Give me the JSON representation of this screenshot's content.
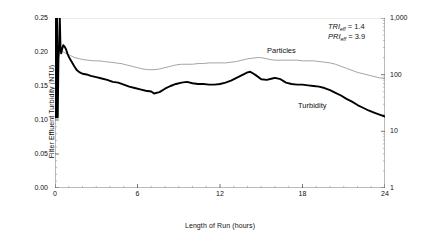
{
  "chart_data": {
    "type": "line",
    "title": "",
    "xlabel": "Length of Run  (hours)",
    "ylabel": "Filter Effluent Turbidity  (NTU)",
    "ylabel_right": "Filter Effluent Particles  (#/mL)",
    "xlim": [
      0,
      24
    ],
    "xticks": [
      "0",
      "6",
      "12",
      "18",
      "24"
    ],
    "xtick_values": [
      0,
      6,
      12,
      18,
      24
    ],
    "x_minor_tick_interval": 1,
    "ylim": [
      0.0,
      0.25
    ],
    "yticks": [
      "0.00",
      "0.05",
      "0.10",
      "0.15",
      "0.20",
      "0.25"
    ],
    "ytick_values": [
      0.0,
      0.05,
      0.1,
      0.15,
      0.2,
      0.25
    ],
    "ylim_right": [
      1,
      1000
    ],
    "yscale_right": "log",
    "yticks_right": [
      "1",
      "10",
      "100",
      "1,000"
    ],
    "ytick_values_right": [
      1,
      10,
      100,
      1000
    ],
    "grid": false,
    "legend_position": "inline-annotations",
    "series": [
      {
        "name": "Turbidity",
        "axis": "left",
        "color": "#000000",
        "width": 1.9,
        "label_text": "Turbidity",
        "x": [
          0.0,
          0.05,
          0.1,
          0.15,
          0.2,
          0.25,
          0.3,
          0.35,
          0.4,
          0.45,
          0.5,
          0.6,
          0.7,
          0.8,
          0.9,
          1.0,
          1.2,
          1.4,
          1.6,
          1.8,
          2.0,
          2.3,
          2.6,
          3.0,
          3.4,
          3.8,
          4.2,
          4.6,
          5.0,
          5.4,
          5.8,
          6.2,
          6.6,
          7.0,
          7.2,
          7.6,
          8.0,
          8.4,
          8.8,
          9.2,
          9.6,
          10.0,
          10.4,
          10.8,
          11.2,
          11.6,
          12.0,
          12.4,
          12.8,
          13.2,
          13.6,
          14.0,
          14.2,
          14.6,
          15.0,
          15.4,
          15.8,
          16.0,
          16.4,
          16.8,
          17.2,
          17.6,
          18.0,
          18.4,
          18.8,
          19.2,
          19.6,
          20.0,
          20.4,
          20.8,
          21.2,
          21.6,
          22.0,
          22.4,
          22.8,
          23.2,
          23.6,
          24.0
        ],
        "y": [
          0.104,
          0.25,
          0.104,
          0.25,
          0.104,
          0.19,
          0.205,
          0.25,
          0.206,
          0.198,
          0.203,
          0.21,
          0.208,
          0.204,
          0.198,
          0.193,
          0.186,
          0.179,
          0.173,
          0.17,
          0.168,
          0.167,
          0.165,
          0.163,
          0.161,
          0.159,
          0.156,
          0.155,
          0.152,
          0.149,
          0.147,
          0.145,
          0.143,
          0.142,
          0.139,
          0.141,
          0.146,
          0.15,
          0.153,
          0.155,
          0.156,
          0.154,
          0.153,
          0.153,
          0.152,
          0.152,
          0.153,
          0.155,
          0.158,
          0.162,
          0.166,
          0.17,
          0.171,
          0.166,
          0.16,
          0.159,
          0.161,
          0.162,
          0.16,
          0.155,
          0.153,
          0.152,
          0.152,
          0.151,
          0.15,
          0.149,
          0.147,
          0.144,
          0.14,
          0.136,
          0.131,
          0.127,
          0.122,
          0.118,
          0.114,
          0.111,
          0.108,
          0.105
        ]
      },
      {
        "name": "Particles",
        "axis": "right",
        "color": "#9a9a9a",
        "width": 0.9,
        "label_text": "Particles",
        "x": [
          0.0,
          0.1,
          0.2,
          0.3,
          0.4,
          0.5,
          0.6,
          0.8,
          1.0,
          1.2,
          1.4,
          1.6,
          1.8,
          2.0,
          2.4,
          2.8,
          3.2,
          3.6,
          4.0,
          4.4,
          4.8,
          5.2,
          5.6,
          6.0,
          6.4,
          6.8,
          7.2,
          7.6,
          8.0,
          8.4,
          8.8,
          9.2,
          9.6,
          10.0,
          10.4,
          10.8,
          11.2,
          11.6,
          12.0,
          12.4,
          12.8,
          13.2,
          13.6,
          14.0,
          14.4,
          14.8,
          15.2,
          15.6,
          16.0,
          16.4,
          16.8,
          17.2,
          17.6,
          18.0,
          18.4,
          18.8,
          19.2,
          19.6,
          20.0,
          20.4,
          20.8,
          21.2,
          21.6,
          22.0,
          22.4,
          22.8,
          23.2,
          23.6,
          24.0
        ],
        "y_left_equiv": [
          0.25,
          0.222,
          0.212,
          0.206,
          0.203,
          0.201,
          0.2,
          0.198,
          0.196,
          0.194,
          0.192,
          0.191,
          0.19,
          0.189,
          0.188,
          0.187,
          0.187,
          0.186,
          0.185,
          0.184,
          0.183,
          0.181,
          0.179,
          0.177,
          0.175,
          0.174,
          0.174,
          0.175,
          0.177,
          0.179,
          0.181,
          0.182,
          0.182,
          0.182,
          0.183,
          0.183,
          0.184,
          0.184,
          0.184,
          0.184,
          0.185,
          0.186,
          0.188,
          0.19,
          0.191,
          0.192,
          0.191,
          0.189,
          0.188,
          0.188,
          0.188,
          0.188,
          0.188,
          0.187,
          0.187,
          0.187,
          0.186,
          0.185,
          0.184,
          0.182,
          0.179,
          0.176,
          0.173,
          0.17,
          0.168,
          0.166,
          0.164,
          0.162,
          0.161
        ]
      }
    ],
    "annotations": [
      {
        "index": "TRI",
        "subscript": "eff",
        "operator": "=",
        "value": "1.4"
      },
      {
        "index": "PRI",
        "subscript": "eff",
        "operator": "=",
        "value": "3.9"
      }
    ]
  },
  "axes": {
    "left_title": "Filter Effluent Turbidity  (NTU)",
    "right_title": "Filter Effluent Particles  (#/mL)",
    "bottom_title": "Length of Run  (hours)"
  },
  "colors": {
    "turbidity": "#000000",
    "particles": "#9a9a9a",
    "axis": "#000000",
    "background": "#ffffff"
  }
}
